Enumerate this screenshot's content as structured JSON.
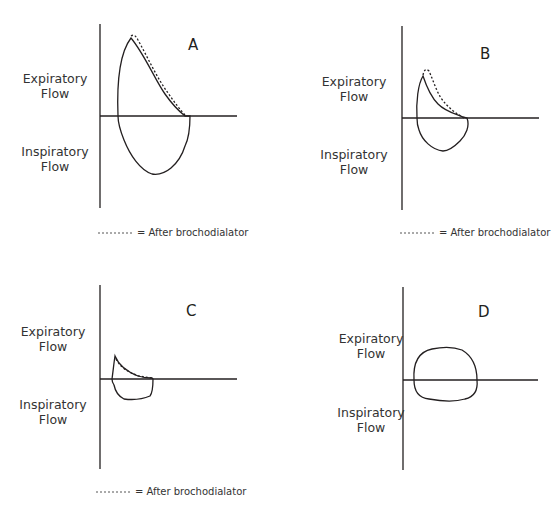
{
  "axis_labels": {
    "expiratory": [
      "Expiratory",
      "Flow"
    ],
    "inspiratory": [
      "Inspiratory",
      "Flow"
    ]
  },
  "legend": {
    "line_style": "dashed",
    "text": "= After brochodialator"
  },
  "panels": [
    {
      "id": "A",
      "label": "A",
      "has_legend": true,
      "description": "Large flow-volume loop with high expiratory peak; post-bronchodilator curve nearly overlapping"
    },
    {
      "id": "B",
      "label": "B",
      "has_legend": true,
      "description": "Reduced loop with scooped expiratory limb; post-bronchodilator curve shows higher peak"
    },
    {
      "id": "C",
      "label": "C",
      "has_legend": true,
      "description": "Very small loop with low peak flow; post-bronchodilator curve nearly unchanged"
    },
    {
      "id": "D",
      "label": "D",
      "has_legend": false,
      "description": "Flattened, rounded loop on both expiratory and inspiratory limbs"
    }
  ],
  "colors": {
    "line": "#231f20",
    "text": "#333333",
    "background": "#ffffff"
  }
}
